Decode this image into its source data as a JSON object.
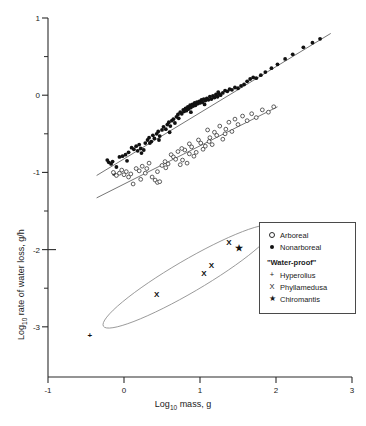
{
  "legend": {
    "items": [
      {
        "symbol": "open-circle",
        "label": "Arboreal"
      },
      {
        "symbol": "filled-circle",
        "label": "Nonarboreal"
      }
    ],
    "group_heading": "\"Water-proof\"",
    "special_items": [
      {
        "symbol": "+",
        "label": "Hyperolius"
      },
      {
        "symbol": "X",
        "label": "Phyllamedusa"
      },
      {
        "symbol": "★",
        "label": "Chiromantis"
      }
    ]
  },
  "chart_data": {
    "type": "scatter",
    "title": "",
    "xlabel": "Log10 mass, g",
    "ylabel": "Log10 rate of water loss, g/h",
    "xlabel_base": "Log",
    "xlabel_sub": "10",
    "xlabel_rest": " mass, g",
    "ylabel_base": "Log",
    "ylabel_sub": "10",
    "ylabel_rest": " rate of water loss, g/h",
    "xlim": [
      -1,
      3
    ],
    "ylim": [
      -3.65,
      1
    ],
    "grid": false,
    "legend_position": "right-middle",
    "xticks": [
      -1,
      0,
      1,
      2,
      3
    ],
    "xtick_labels": [
      "-1",
      "0",
      "1",
      "2",
      "3"
    ],
    "yticks": [
      1,
      0,
      -1,
      -2,
      -3
    ],
    "ytick_labels": [
      "1",
      "0",
      "-1",
      "-2",
      "-3"
    ],
    "yticks_minor": [
      0.5,
      -0.5,
      -1.5,
      -2.5
    ],
    "series": [
      {
        "name": "Nonarboreal",
        "marker": "filled-circle",
        "points": [
          [
            -0.22,
            -0.84
          ],
          [
            -0.2,
            -0.87
          ],
          [
            -0.17,
            -0.89
          ],
          [
            -0.15,
            -0.86
          ],
          [
            -0.13,
            -1.02
          ],
          [
            -0.1,
            -0.93
          ],
          [
            -0.06,
            -0.8
          ],
          [
            -0.02,
            -0.79
          ],
          [
            0.02,
            -0.77
          ],
          [
            0.06,
            -0.74
          ],
          [
            0.1,
            -0.68
          ],
          [
            0.13,
            -0.7
          ],
          [
            0.16,
            -0.66
          ],
          [
            0.18,
            -0.72
          ],
          [
            0.2,
            -0.64
          ],
          [
            0.23,
            -0.75
          ],
          [
            0.26,
            -0.71
          ],
          [
            0.28,
            -0.62
          ],
          [
            0.31,
            -0.58
          ],
          [
            0.33,
            -0.55
          ],
          [
            0.36,
            -0.6
          ],
          [
            0.38,
            -0.52
          ],
          [
            0.4,
            -0.56
          ],
          [
            0.43,
            -0.5
          ],
          [
            0.45,
            -0.47
          ],
          [
            0.47,
            -0.53
          ],
          [
            0.5,
            -0.45
          ],
          [
            0.52,
            -0.41
          ],
          [
            0.55,
            -0.44
          ],
          [
            0.57,
            -0.38
          ],
          [
            0.59,
            -0.35
          ],
          [
            0.61,
            -0.4
          ],
          [
            0.63,
            -0.33
          ],
          [
            0.65,
            -0.31
          ],
          [
            0.67,
            -0.36
          ],
          [
            0.69,
            -0.28
          ],
          [
            0.71,
            -0.25
          ],
          [
            0.72,
            -0.3
          ],
          [
            0.74,
            -0.22
          ],
          [
            0.76,
            -0.24
          ],
          [
            0.78,
            -0.19
          ],
          [
            0.79,
            -0.21
          ],
          [
            0.81,
            -0.17
          ],
          [
            0.82,
            -0.2
          ],
          [
            0.84,
            -0.15
          ],
          [
            0.85,
            -0.18
          ],
          [
            0.87,
            -0.13
          ],
          [
            0.88,
            -0.16
          ],
          [
            0.9,
            -0.12
          ],
          [
            0.91,
            -0.14
          ],
          [
            0.93,
            -0.1
          ],
          [
            0.94,
            -0.13
          ],
          [
            0.96,
            -0.09
          ],
          [
            0.97,
            -0.11
          ],
          [
            0.99,
            -0.08
          ],
          [
            1.0,
            -0.1
          ],
          [
            1.02,
            -0.06
          ],
          [
            1.03,
            -0.09
          ],
          [
            1.05,
            -0.05
          ],
          [
            1.07,
            -0.07
          ],
          [
            1.09,
            -0.04
          ],
          [
            1.11,
            -0.06
          ],
          [
            1.13,
            -0.02
          ],
          [
            1.15,
            -0.05
          ],
          [
            1.17,
            -0.01
          ],
          [
            1.19,
            -0.03
          ],
          [
            1.21,
            0.01
          ],
          [
            1.23,
            -0.02
          ],
          [
            1.25,
            0.02
          ],
          [
            1.27,
            0.0
          ],
          [
            1.3,
            0.03
          ],
          [
            1.33,
            0.06
          ],
          [
            1.36,
            0.05
          ],
          [
            1.39,
            0.08
          ],
          [
            1.42,
            0.07
          ],
          [
            1.46,
            0.1
          ],
          [
            1.5,
            0.09
          ],
          [
            1.54,
            0.12
          ],
          [
            1.58,
            0.14
          ],
          [
            1.62,
            0.18
          ],
          [
            1.66,
            0.21
          ],
          [
            1.7,
            0.23
          ],
          [
            1.74,
            0.22
          ],
          [
            1.8,
            0.26
          ],
          [
            1.86,
            0.3
          ],
          [
            1.94,
            0.35
          ],
          [
            2.02,
            0.4
          ],
          [
            2.12,
            0.47
          ],
          [
            2.22,
            0.53
          ],
          [
            2.36,
            0.62
          ],
          [
            2.48,
            0.68
          ],
          [
            2.58,
            0.73
          ],
          [
            0.6,
            -0.48
          ],
          [
            0.88,
            -0.22
          ],
          [
            1.06,
            -0.12
          ],
          [
            1.24,
            0.04
          ],
          [
            0.46,
            -0.58
          ],
          [
            0.34,
            -0.62
          ],
          [
            0.22,
            -0.69
          ],
          [
            0.04,
            -0.85
          ]
        ]
      },
      {
        "name": "Arboreal",
        "marker": "open-circle",
        "points": [
          [
            -0.14,
            -1.0
          ],
          [
            -0.1,
            -1.04
          ],
          [
            -0.06,
            -1.01
          ],
          [
            -0.03,
            -0.97
          ],
          [
            0.0,
            -1.03
          ],
          [
            0.03,
            -0.99
          ],
          [
            0.06,
            -1.06
          ],
          [
            0.09,
            -1.02
          ],
          [
            0.12,
            -1.15
          ],
          [
            0.16,
            -0.95
          ],
          [
            0.2,
            -0.98
          ],
          [
            0.24,
            -0.92
          ],
          [
            0.28,
            -1.01
          ],
          [
            0.33,
            -0.88
          ],
          [
            0.37,
            -1.06
          ],
          [
            0.41,
            -1.1
          ],
          [
            0.44,
            -1.13
          ],
          [
            0.47,
            -1.12
          ],
          [
            0.5,
            -0.91
          ],
          [
            0.54,
            -0.86
          ],
          [
            0.58,
            -0.89
          ],
          [
            0.62,
            -0.77
          ],
          [
            0.65,
            -0.8
          ],
          [
            0.68,
            -0.83
          ],
          [
            0.71,
            -0.73
          ],
          [
            0.74,
            -0.9
          ],
          [
            0.77,
            -0.84
          ],
          [
            0.8,
            -0.71
          ],
          [
            0.83,
            -0.88
          ],
          [
            0.86,
            -0.63
          ],
          [
            0.89,
            -0.67
          ],
          [
            0.92,
            -0.79
          ],
          [
            0.95,
            -0.74
          ],
          [
            0.98,
            -0.58
          ],
          [
            1.01,
            -0.62
          ],
          [
            1.04,
            -0.7
          ],
          [
            1.07,
            -0.66
          ],
          [
            1.1,
            -0.45
          ],
          [
            1.13,
            -0.55
          ],
          [
            1.16,
            -0.64
          ],
          [
            1.19,
            -0.48
          ],
          [
            1.22,
            -0.52
          ],
          [
            1.26,
            -0.4
          ],
          [
            1.3,
            -0.57
          ],
          [
            1.34,
            -0.44
          ],
          [
            1.38,
            -0.35
          ],
          [
            1.42,
            -0.47
          ],
          [
            1.46,
            -0.31
          ],
          [
            1.5,
            -0.38
          ],
          [
            1.56,
            -0.27
          ],
          [
            1.62,
            -0.33
          ],
          [
            1.68,
            -0.24
          ],
          [
            1.74,
            -0.29
          ],
          [
            1.82,
            -0.19
          ],
          [
            1.9,
            -0.22
          ],
          [
            1.97,
            -0.15
          ],
          [
            0.3,
            -0.95
          ],
          [
            0.55,
            -0.94
          ],
          [
            0.76,
            -0.69
          ],
          [
            1.12,
            -0.6
          ],
          [
            0.22,
            -1.09
          ],
          [
            0.44,
            -0.99
          ],
          [
            0.86,
            -0.76
          ],
          [
            1.33,
            -0.5
          ]
        ]
      }
    ],
    "fit_lines": [
      {
        "name": "Nonarboreal fit",
        "x0": -0.36,
        "y0": -1.04,
        "x1": 2.72,
        "y1": 0.8
      },
      {
        "name": "Arboreal fit",
        "x0": -0.36,
        "y0": -1.33,
        "x1": 2.02,
        "y1": -0.15
      }
    ],
    "waterproof_group": {
      "outline": "ellipse",
      "points": [
        {
          "label": "Hyperolius",
          "marker": "+",
          "x": -0.45,
          "y": -3.11
        },
        {
          "label": "Phyllamedusa",
          "marker": "X",
          "x": 0.43,
          "y": -2.58
        },
        {
          "label": "Phyllamedusa",
          "marker": "X",
          "x": 1.05,
          "y": -2.31
        },
        {
          "label": "Phyllamedusa",
          "marker": "X",
          "x": 1.15,
          "y": -2.2
        },
        {
          "label": "Phyllamedusa",
          "marker": "X",
          "x": 1.38,
          "y": -1.91
        },
        {
          "label": "Chiromantis",
          "marker": "★",
          "x": 1.51,
          "y": -1.98
        }
      ]
    }
  }
}
